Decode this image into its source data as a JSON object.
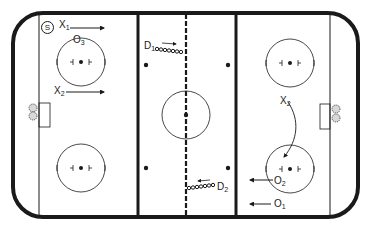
{
  "diagram": {
    "title": "",
    "type": "hockey-rink-drill",
    "colors": {
      "ink": "#1a1a1a",
      "background": "#ffffff"
    },
    "start_marker": "S",
    "players": [
      {
        "id": "X1",
        "base": "X",
        "sub": "1",
        "role": "forward",
        "direction": "right"
      },
      {
        "id": "X2-left",
        "base": "X",
        "sub": "2",
        "role": "forward",
        "direction": "right"
      },
      {
        "id": "O3",
        "base": "O",
        "sub": "3",
        "role": "player"
      },
      {
        "id": "D1",
        "base": "D",
        "sub": "1",
        "role": "defense",
        "direction": "right"
      },
      {
        "id": "D2",
        "base": "D",
        "sub": "2",
        "role": "defense",
        "direction": "left"
      },
      {
        "id": "X2-right",
        "base": "X",
        "sub": "2",
        "role": "forward",
        "direction": "curve-down"
      },
      {
        "id": "O2",
        "base": "O",
        "sub": "2",
        "role": "player",
        "direction": "left"
      },
      {
        "id": "O1",
        "base": "O",
        "sub": "1",
        "role": "player",
        "direction": "left"
      }
    ]
  }
}
